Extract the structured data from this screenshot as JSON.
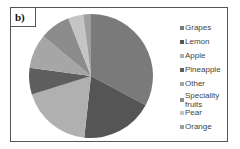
{
  "panel_label": "b)",
  "chart_data": {
    "type": "pie",
    "title": "",
    "categories": [
      "Grapes",
      "Lemon",
      "Apple",
      "Pineapple",
      "Other",
      "Speciality fruits",
      "Pear",
      "Orange"
    ],
    "values": [
      33,
      19,
      18.5,
      7,
      9,
      8,
      4,
      2
    ],
    "colors": [
      "#7a7a7a",
      "#555555",
      "#b0b0b0",
      "#5e5e5e",
      "#a6a6a6",
      "#8c8c8c",
      "#c4c4c4",
      "#9e9e9e"
    ],
    "start_angle_deg": 0,
    "direction": "clockwise",
    "legend_position": "right",
    "units": "percent (estimated)"
  },
  "legend": {
    "items": [
      {
        "label": "Grapes"
      },
      {
        "label": "Lemon"
      },
      {
        "label": "Apple"
      },
      {
        "label": "Pineapple"
      },
      {
        "label": "Other"
      },
      {
        "label_line1": "Speciality",
        "label_line2": "fruits"
      },
      {
        "label": "Pear"
      },
      {
        "label": "Orange"
      }
    ]
  }
}
